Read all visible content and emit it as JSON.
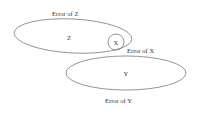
{
  "diagram": {
    "title": "",
    "colors": {
      "stroke": "#7a7a7a",
      "text": "#333333",
      "background": "#ffffff"
    },
    "shapes": [
      {
        "id": "Z",
        "label": "Z",
        "type": "ellipse",
        "cx": 73,
        "cy": 36,
        "rx": 60,
        "ry": 17,
        "rotate": 3
      },
      {
        "id": "X",
        "label": "X",
        "type": "circle",
        "cx": 116,
        "cy": 42,
        "r": 8
      },
      {
        "id": "Y",
        "label": "Y",
        "type": "ellipse",
        "cx": 126,
        "cy": 73,
        "rx": 60,
        "ry": 17,
        "rotate": 0
      }
    ],
    "labels": {
      "z": "Z",
      "x": "X",
      "y": "Y",
      "error_z": "Error of Z",
      "error_x": "Error of X",
      "error_y": "Error of Y"
    }
  }
}
